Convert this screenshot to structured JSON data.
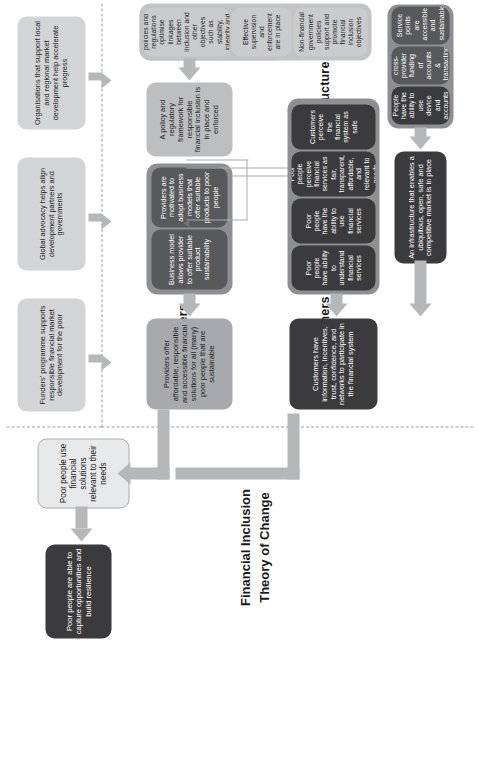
{
  "diagram": {
    "title": "Financial Inclusion\nTheory of Change",
    "sections": {
      "influence": "Influence",
      "providers": "Providers",
      "policy": "Policy",
      "customers": "Customers",
      "infrastructure": "Infrastructure"
    },
    "impact": {
      "label": "Poor people are able to capture opportunities and build resilience"
    },
    "outcome": {
      "label": "Poor people use financial solutions relevant to their needs"
    },
    "influence_boxes": [
      {
        "label": "Funders' programme supports responsible financial market development for the poor"
      },
      {
        "label": "Global advocacy helps align development partners and governments"
      },
      {
        "label": "Organisations that support local and regional market development help accelerate progress"
      }
    ],
    "providers": {
      "headline": "Providers offer affordable, responsible and accessible financial solutions for all (many) poor people that are sustainable",
      "boxes": [
        {
          "label": "Business model allows provider to offer suitable product sustainability"
        },
        {
          "label": "Providers are motivated to adopt business models that offer suitable products to poor people"
        }
      ]
    },
    "customers": {
      "headline": "Customers have information, incentives, trust, confidence, and networks to participate in the financial system",
      "boxes": [
        {
          "label": "Poor people have ability to understand financial services"
        },
        {
          "label": "Poor people have the ability to use financial services"
        },
        {
          "label": "Poor people perceive financial services as fair, transparent, affordable, and relevant to needs"
        },
        {
          "label": "Customers perceive the financial system as safe"
        }
      ]
    },
    "policy": {
      "headline": "A policy and regulatory framework for responsible financial inclusion is in place and enforced",
      "boxes": [
        {
          "label": "Financial sector policies and regulations optimise linkages between inclusion and other objectives such as stability, integrity and consumer protection"
        },
        {
          "label": "Effective supervision and enforcement are in place"
        },
        {
          "label": "Non-financial government policies support and promote financial inclusion objectives"
        }
      ]
    },
    "infrastructure": {
      "headline": "An infrastructure that enables a ubiquitous, open, safe and competitive market is in place",
      "boxes": [
        {
          "label": "People have the ability to use device and accounts"
        },
        {
          "label": "Interoperability allows cross-provider funding of accounts & transacting/ accessing of funds"
        },
        {
          "label": "Service points are accessible and sustainable"
        }
      ]
    },
    "colors": {
      "impact_box": "#3b3b3d",
      "outcome_box": "#e8e9ea",
      "influence_box": "#d3d4d6",
      "arrow": "#b5b7b9",
      "group_dark": "#8d8f92",
      "group_light": "#c1c3c5",
      "separator": "#9aa0a6"
    }
  }
}
